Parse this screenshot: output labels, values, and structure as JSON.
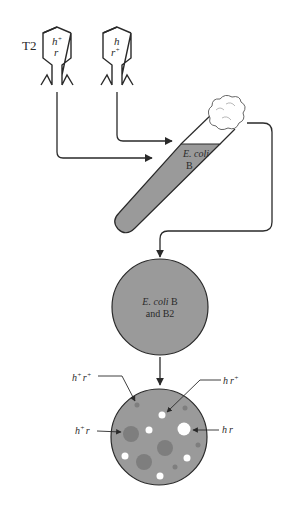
{
  "phages": {
    "label": "T2",
    "phage1": {
      "h": "h",
      "h_sup": "+",
      "r": "r",
      "r_sup": ""
    },
    "phage2": {
      "h": "h",
      "h_sup": "",
      "r": "r",
      "r_sup": "+"
    }
  },
  "tube": {
    "line1": "E. coli",
    "line2": "B"
  },
  "plate1": {
    "line1_italic": "E. coli",
    "line1_rest": " B",
    "line2": "and B2"
  },
  "plate2": {
    "labels": {
      "hp_rp": {
        "h": "h",
        "h_sup": "+",
        "r": "r",
        "r_sup": "+"
      },
      "hp_r": {
        "h": "h",
        "h_sup": "+",
        "r": "r"
      },
      "h_rp": {
        "h": "h",
        "r": "r",
        "r_sup": "+"
      },
      "h_r": {
        "h": "h",
        "r": "r"
      }
    }
  },
  "colors": {
    "line": "#2a2a2a",
    "fill_gray": "#9a9a9a",
    "plaque_dark": "#7e7e7e",
    "plaque_clear": "#ffffff"
  }
}
